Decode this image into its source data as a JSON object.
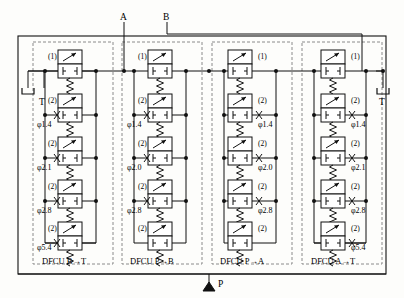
{
  "diagram": {
    "type": "hydraulic-circuit",
    "ports": [
      {
        "id": "T-left",
        "label": "T",
        "symbol": "tank",
        "x": 44,
        "y": 95
      },
      {
        "id": "A",
        "label": "A",
        "symbol": "line",
        "x": 124,
        "y": 18
      },
      {
        "id": "B",
        "label": "B",
        "symbol": "line",
        "x": 167,
        "y": 18
      },
      {
        "id": "T-right",
        "label": "T",
        "symbol": "tank",
        "x": 383,
        "y": 95
      },
      {
        "id": "P",
        "label": "P",
        "symbol": "pressure-source",
        "x": 209,
        "y": 287
      }
    ],
    "groups": [
      {
        "id": "dfcu-b-t",
        "label": "DFCU B→T",
        "valves": [
          {
            "index": "(1)",
            "diameter": ""
          },
          {
            "index": "(2)",
            "diameter": "φ1.4"
          },
          {
            "index": "(2)",
            "diameter": "φ2.1"
          },
          {
            "index": "(2)",
            "diameter": "φ2.8"
          },
          {
            "index": "(2)",
            "diameter": "φ5.4"
          }
        ]
      },
      {
        "id": "dfcu-p-b",
        "label": "DFCU P→B",
        "valves": [
          {
            "index": "(1)",
            "diameter": ""
          },
          {
            "index": "(2)",
            "diameter": "φ1.4"
          },
          {
            "index": "(2)",
            "diameter": "φ2.0"
          },
          {
            "index": "(2)",
            "diameter": "φ2.8"
          },
          {
            "index": "(2)",
            "diameter": ""
          }
        ]
      },
      {
        "id": "dfcu-p-a",
        "label": "DFCU P→A",
        "valves": [
          {
            "index": "(1)",
            "diameter": ""
          },
          {
            "index": "(2)",
            "diameter": "φ1.4"
          },
          {
            "index": "(2)",
            "diameter": "φ2.0"
          },
          {
            "index": "(2)",
            "diameter": "φ2.8"
          },
          {
            "index": "(2)",
            "diameter": ""
          }
        ]
      },
      {
        "id": "dfcu-a-t",
        "label": "DFCU A→T",
        "valves": [
          {
            "index": "(1)",
            "diameter": ""
          },
          {
            "index": "(2)",
            "diameter": "φ1.4"
          },
          {
            "index": "(2)",
            "diameter": "φ2.1"
          },
          {
            "index": "(2)",
            "diameter": "φ2.8"
          },
          {
            "index": "(2)",
            "diameter": "φ5.4"
          }
        ]
      }
    ],
    "colors": {
      "line": "#1a1a1a",
      "dashed": "#8a8a8a",
      "background": "#fdfdfb"
    }
  }
}
